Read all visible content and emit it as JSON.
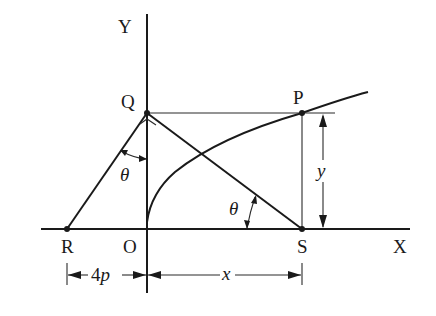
{
  "diagram": {
    "type": "geometry",
    "axes": {
      "x_label": "X",
      "y_label": "Y",
      "origin_label": "O"
    },
    "points": [
      {
        "id": "Q",
        "label": "Q"
      },
      {
        "id": "P",
        "label": "P"
      },
      {
        "id": "R",
        "label": "R"
      },
      {
        "id": "S",
        "label": "S"
      }
    ],
    "angles": [
      {
        "id": "angle-RQO",
        "label": "θ"
      },
      {
        "id": "angle-QSO",
        "label": "θ"
      }
    ],
    "dimensions": [
      {
        "id": "dim-RO",
        "label": "4p",
        "label_prefix": "4",
        "label_var": "p"
      },
      {
        "id": "dim-OS",
        "label": "x"
      },
      {
        "id": "dim-SP",
        "label": "y"
      }
    ],
    "curve": {
      "name": "parabola",
      "equation": "y^2 = 4px"
    },
    "colors": {
      "ink": "#1a1a1a",
      "background": "#ffffff"
    }
  }
}
